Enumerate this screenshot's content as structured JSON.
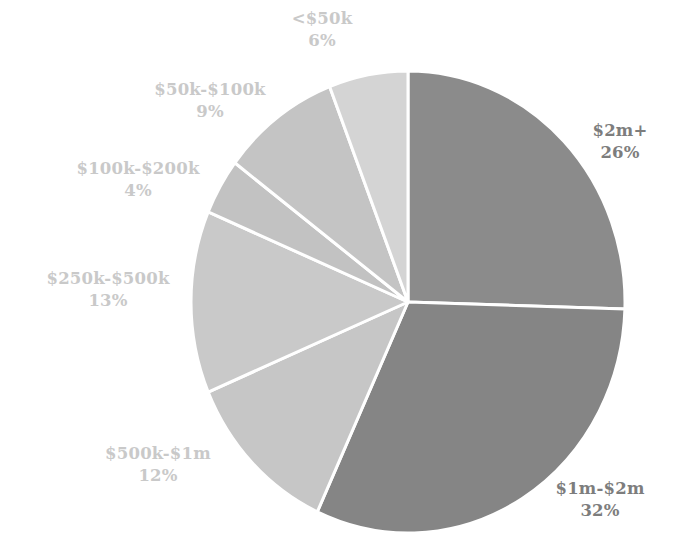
{
  "chart_data": {
    "type": "pie",
    "title": "",
    "subtitle": "",
    "xlabel": "",
    "ylabel": "",
    "legend_position": "none",
    "grid": false,
    "value_unit": "percent",
    "total": 102,
    "start_angle_deg": 0,
    "direction": "clockwise",
    "categories": [
      "$2m+",
      "$1m-$2m",
      "$500k-$1m",
      "$250k-$500k",
      "$100k-$200k",
      "$50k-$100k",
      "<$50k"
    ],
    "values": [
      26,
      32,
      12,
      13,
      4,
      9,
      6
    ],
    "slices": [
      {
        "id": "slice-2mplus",
        "label": "$2m+",
        "percent_text": "26%",
        "value": 26,
        "color": "#8b8b8b",
        "label_color": "#7d7d7d",
        "label_tone": "dark",
        "start_deg": 0,
        "end_deg": 91.76
      },
      {
        "id": "slice-1m-2m",
        "label": "$1m-$2m",
        "percent_text": "32%",
        "value": 32,
        "color": "#858585",
        "label_color": "#7d7d7d",
        "label_tone": "dark",
        "start_deg": 91.76,
        "end_deg": 204.71
      },
      {
        "id": "slice-500k-1m",
        "label": "$500k-$1m",
        "percent_text": "12%",
        "value": 12,
        "color": "#c6c6c6",
        "label_color": "#c9c9c9",
        "label_tone": "light",
        "start_deg": 204.71,
        "end_deg": 247.06
      },
      {
        "id": "slice-250k-500k",
        "label": "$250k-$500k",
        "percent_text": "13%",
        "value": 13,
        "color": "#c9c9c9",
        "label_color": "#c9c9c9",
        "label_tone": "light",
        "start_deg": 247.06,
        "end_deg": 292.94
      },
      {
        "id": "slice-100k-200k",
        "label": "$100k-$200k",
        "percent_text": "4%",
        "value": 4,
        "color": "#c2c2c2",
        "label_color": "#c9c9c9",
        "label_tone": "light",
        "start_deg": 292.94,
        "end_deg": 307.06
      },
      {
        "id": "slice-50k-100k",
        "label": "$50k-$100k",
        "percent_text": "9%",
        "value": 9,
        "color": "#c4c4c4",
        "label_color": "#c9c9c9",
        "label_tone": "light",
        "start_deg": 307.06,
        "end_deg": 338.82
      },
      {
        "id": "slice-lt50k",
        "label": "<$50k",
        "percent_text": "6%",
        "value": 6,
        "color": "#d4d4d4",
        "label_color": "#c9c9c9",
        "label_tone": "light",
        "start_deg": 338.82,
        "end_deg": 360
      }
    ],
    "geometry": {
      "center_x": 408,
      "center_y": 302,
      "radius_x": 217,
      "radius_y": 231,
      "divider_color": "#ffffff",
      "divider_width": 3,
      "background": "#ffffff"
    }
  }
}
